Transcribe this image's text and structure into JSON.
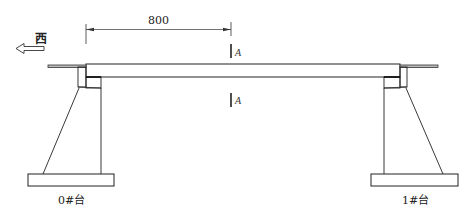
{
  "diagram": {
    "direction_label": "西",
    "direction_arrow": "left-arrow",
    "dimension": {
      "value": "800"
    },
    "section_mark": {
      "top_label": "A",
      "bottom_label": "A"
    },
    "abutments": [
      {
        "label": "0#台"
      },
      {
        "label": "1#台"
      }
    ],
    "colors": {
      "line": "#222222",
      "background": "#ffffff"
    }
  }
}
